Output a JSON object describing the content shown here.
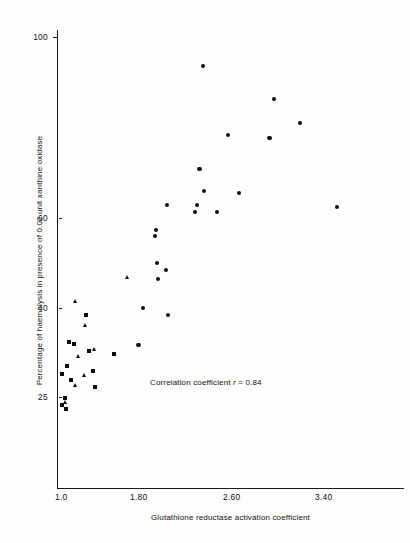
{
  "chart_data": {
    "type": "scatter",
    "title": "",
    "xlabel": "Glutathione reductase activation coefficient",
    "ylabel": "Percentage of haemolysis in presence of 0.02 unit xanthine oxidase",
    "xlim": [
      1.0,
      3.7
    ],
    "ylim": [
      20,
      103
    ],
    "xticks": [
      1.0,
      1.8,
      2.6,
      3.4
    ],
    "xticklabels": [
      "1.0",
      "1.80",
      "2.60",
      "3.40"
    ],
    "yticks": [
      25,
      40,
      60,
      100
    ],
    "yticklabels": [
      "25",
      "40",
      "60",
      "100"
    ],
    "grid": false,
    "legend": null,
    "annotation": "Correlation coefficient r = 0.84",
    "annotation_prefix": "Correlation coefficient ",
    "annotation_italic": "r",
    "annotation_suffix": " = 0.84",
    "correlation_r": 0.84,
    "series": [
      {
        "name": "circle-markers",
        "marker": "circle",
        "color": "#0d0d0d",
        "points": [
          {
            "x": 2.29,
            "y": 94.0
          },
          {
            "x": 2.94,
            "y": 87.0
          },
          {
            "x": 3.18,
            "y": 82.0
          },
          {
            "x": 2.52,
            "y": 79.5
          },
          {
            "x": 2.9,
            "y": 79.0
          },
          {
            "x": 2.26,
            "y": 72.5
          },
          {
            "x": 2.3,
            "y": 68.0
          },
          {
            "x": 2.62,
            "y": 67.5
          },
          {
            "x": 1.96,
            "y": 65.0
          },
          {
            "x": 2.24,
            "y": 65.0
          },
          {
            "x": 3.52,
            "y": 64.5
          },
          {
            "x": 2.22,
            "y": 63.5
          },
          {
            "x": 2.42,
            "y": 63.5
          },
          {
            "x": 1.86,
            "y": 59.8
          },
          {
            "x": 1.85,
            "y": 58.5
          },
          {
            "x": 1.87,
            "y": 53.0
          },
          {
            "x": 1.95,
            "y": 51.5
          },
          {
            "x": 1.88,
            "y": 49.5
          },
          {
            "x": 1.74,
            "y": 43.5
          },
          {
            "x": 1.97,
            "y": 42.0
          },
          {
            "x": 1.7,
            "y": 35.8
          }
        ]
      },
      {
        "name": "square-markers",
        "marker": "square",
        "color": "#0d0d0d",
        "points": [
          {
            "x": 1.22,
            "y": 42.0
          },
          {
            "x": 1.06,
            "y": 36.5
          },
          {
            "x": 1.11,
            "y": 36.0
          },
          {
            "x": 1.25,
            "y": 34.5
          },
          {
            "x": 1.48,
            "y": 34.0
          },
          {
            "x": 1.05,
            "y": 31.5
          },
          {
            "x": 1.28,
            "y": 30.5
          },
          {
            "x": 1.0,
            "y": 29.8
          },
          {
            "x": 1.08,
            "y": 28.5
          },
          {
            "x": 1.3,
            "y": 27.0
          },
          {
            "x": 1.03,
            "y": 24.7
          },
          {
            "x": 1.0,
            "y": 23.3
          },
          {
            "x": 1.04,
            "y": 22.6
          }
        ]
      },
      {
        "name": "triangle-markers",
        "marker": "triangle",
        "color": "#0d0d0d",
        "points": [
          {
            "x": 1.6,
            "y": 50.0
          },
          {
            "x": 1.12,
            "y": 45.0
          },
          {
            "x": 1.22,
            "y": 40.0
          },
          {
            "x": 1.3,
            "y": 35.0
          },
          {
            "x": 1.15,
            "y": 33.5
          },
          {
            "x": 1.21,
            "y": 29.5
          },
          {
            "x": 1.12,
            "y": 27.5
          },
          {
            "x": 1.03,
            "y": 23.9
          }
        ]
      }
    ]
  },
  "axes": {
    "y_title": "Percentage of haemolysis in presence of 0.02 unit xanthine oxidase",
    "x_title": "Glutathione reductase activation coefficient",
    "y_tick_labels": [
      "100",
      "60",
      "40",
      "25"
    ],
    "x_tick_labels": [
      "1.0",
      "1.80",
      "2.60",
      "3.40"
    ]
  },
  "colors": {
    "marker": "#0d0d0d",
    "axis": "#1a1a1a",
    "background": "#fdfdfc",
    "text": "#111111"
  }
}
